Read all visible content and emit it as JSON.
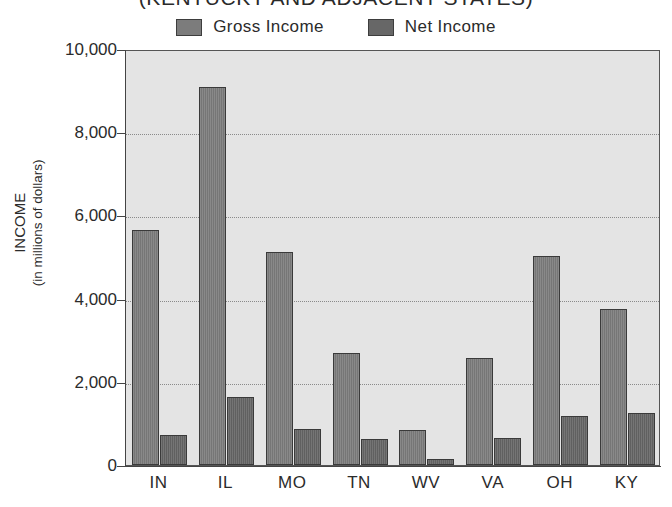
{
  "chart_data": {
    "type": "bar",
    "title": "(KENTUCKY AND ADJACENT STATES)",
    "xlabel": "",
    "ylabel": "INCOME",
    "ylabel_sub": "(in millions of dollars)",
    "ylim": [
      0,
      10000
    ],
    "yticks": [
      0,
      2000,
      4000,
      6000,
      8000,
      10000
    ],
    "ytick_labels": [
      "0",
      "2,000",
      "4,000",
      "6,000",
      "8,000",
      "10,000"
    ],
    "grid": true,
    "grid_axis": "y",
    "grid_style": "dotted",
    "legend_position": "top-center",
    "categories": [
      "IN",
      "IL",
      "MO",
      "TN",
      "WV",
      "VA",
      "OH",
      "KY"
    ],
    "series": [
      {
        "name": "Gross  Income",
        "color": "#7c7c7c",
        "values": [
          5650,
          9080,
          5130,
          2700,
          850,
          2580,
          5030,
          3760
        ]
      },
      {
        "name": "Net  Income",
        "color": "#676767",
        "values": [
          730,
          1640,
          860,
          620,
          150,
          640,
          1180,
          1250
        ]
      }
    ]
  },
  "legend": {
    "items": [
      {
        "label": "Gross  Income",
        "swatch_color": "#7c7c7c"
      },
      {
        "label": "Net  Income",
        "swatch_color": "#676767"
      }
    ]
  },
  "axes": {
    "y_title_main": "INCOME",
    "y_title_sub": "(in millions of dollars)"
  }
}
